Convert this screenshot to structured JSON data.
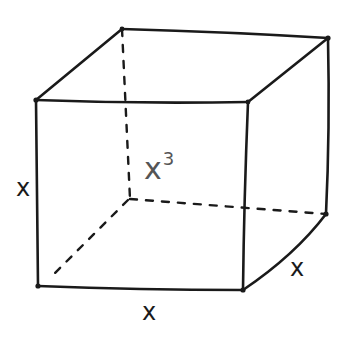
{
  "diagram": {
    "shape": "cube",
    "style": "hand-drawn",
    "labels": {
      "height": "x",
      "width": "x",
      "depth": "x",
      "volume_base": "x",
      "volume_exponent": "3"
    },
    "colors": {
      "stroke": "#1a1a1a",
      "volume_label": "#555555",
      "background": "#ffffff"
    }
  }
}
